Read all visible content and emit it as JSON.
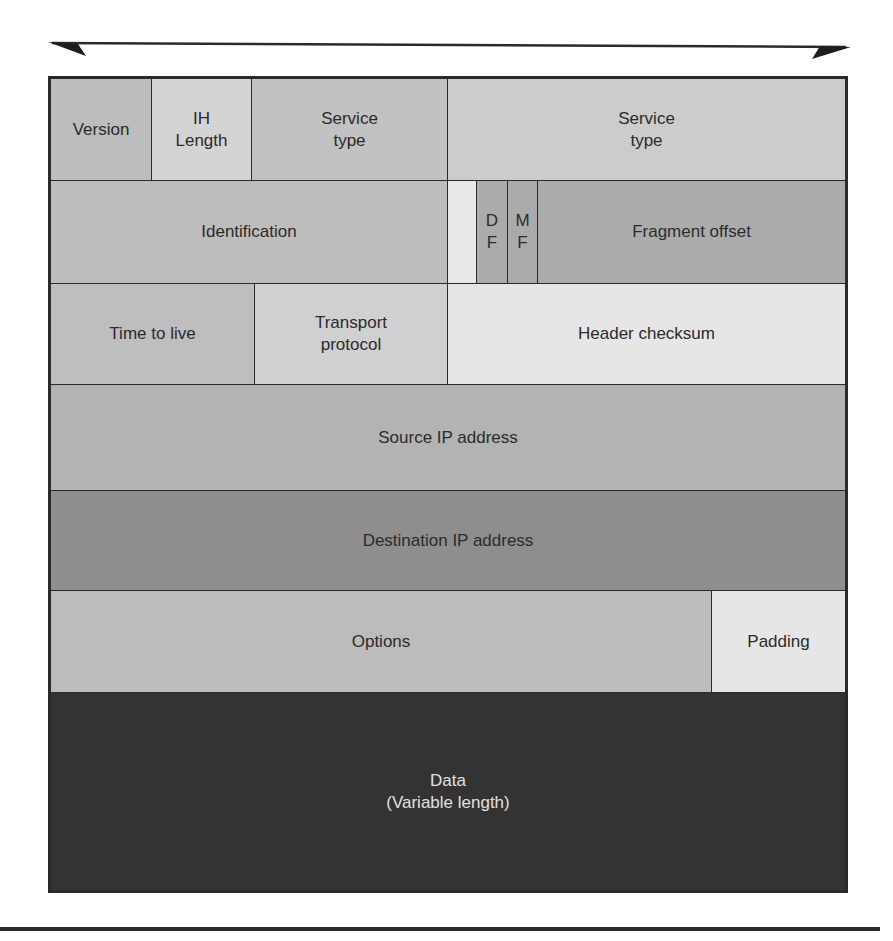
{
  "diagram": {
    "title_arrow": "32-bit word width arrow",
    "colors": {
      "border": "#2a2a2a",
      "light": "#e6e6e6",
      "medium_light": "#cfcfcf",
      "medium": "#bdbdbd",
      "medium_dark": "#a6a6a6",
      "dark": "#8c8c8c",
      "data_bg": "#333333",
      "data_text": "#e0e0e0",
      "text": "#2b2b2b"
    },
    "rows": [
      {
        "fields": [
          {
            "label": "Version"
          },
          {
            "label": "IH\nLength"
          },
          {
            "label": "Service\ntype"
          },
          {
            "label": "Service\ntype"
          }
        ]
      },
      {
        "fields": [
          {
            "label": "Identification"
          },
          {
            "label": ""
          },
          {
            "label": "D\nF"
          },
          {
            "label": "M\nF"
          },
          {
            "label": "Fragment offset"
          }
        ]
      },
      {
        "fields": [
          {
            "label": "Time to live"
          },
          {
            "label": "Transport\nprotocol"
          },
          {
            "label": "Header checksum"
          }
        ]
      },
      {
        "fields": [
          {
            "label": "Source IP address"
          }
        ]
      },
      {
        "fields": [
          {
            "label": "Destination IP address"
          }
        ]
      },
      {
        "fields": [
          {
            "label": "Options"
          },
          {
            "label": "Padding"
          }
        ]
      },
      {
        "fields": [
          {
            "label": "Data\n(Variable length)"
          }
        ]
      }
    ]
  }
}
